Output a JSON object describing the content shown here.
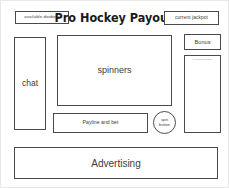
{
  "diagram": {
    "kind": "ui-wireframe-mockup",
    "header": {
      "title": "Pro Hockey Payout",
      "available_doobers_label": "available doobers",
      "current_jackpot_label": "current jackpot"
    },
    "panels": {
      "chat_label": "chat",
      "spinners_label": "spinners",
      "payline_and_bet_label": "Payline and bet",
      "spin_button_line1": "spin",
      "spin_button_line2": "button",
      "bonus_label": "Bonus",
      "recent_winners_label": "recent winners",
      "advertising_label": "Advertising"
    },
    "colors": {
      "stroke": "#4a4a4a",
      "text": "#3c3c3c",
      "title_text": "#1a1a1a",
      "background": "#ffffff",
      "outer_border": "#e8e8e8",
      "faint_text": "#8a8a8a"
    }
  }
}
